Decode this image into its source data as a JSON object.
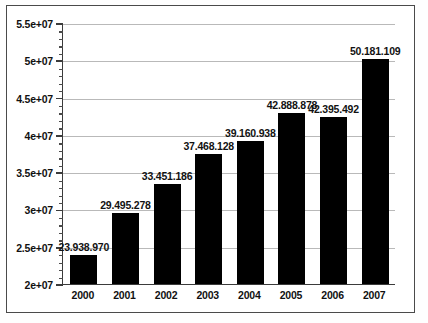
{
  "chart_data": {
    "type": "bar",
    "title": "",
    "subtitle": "",
    "xlabel": "",
    "ylabel": "",
    "categories": [
      "2000",
      "2001",
      "2002",
      "2003",
      "2004",
      "2005",
      "2006",
      "2007"
    ],
    "values": [
      23938970,
      29495278,
      33451186,
      37468128,
      39160938,
      42888878,
      42395492,
      50181109
    ],
    "data_labels": [
      "23.938.970",
      "29.495.278",
      "33.451.186",
      "37.468.128",
      "39.160.938",
      "42.888.878",
      "42.395.492",
      "50.181.109"
    ],
    "ylim": [
      20000000,
      55000000
    ],
    "ytick_labels": [
      "5.5e+07",
      "5e+07",
      "4.5e+07",
      "4e+07",
      "3.5e+07",
      "3e+07",
      "2.5e+07",
      "2e+07"
    ],
    "ytick_values": [
      55000000,
      50000000,
      45000000,
      40000000,
      35000000,
      30000000,
      25000000,
      20000000
    ],
    "minor_ticks_per_interval": 4,
    "grid": true,
    "grid_axis": "y",
    "legend": null,
    "legend_position": "none",
    "bar_color": "#000000",
    "grid_color": "#b9b9b9",
    "axis_color": "#3b3b3b",
    "frame_color": "#4a4a4a",
    "background_color": "#ffffff"
  }
}
